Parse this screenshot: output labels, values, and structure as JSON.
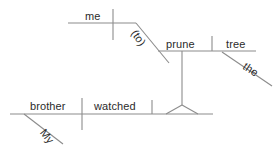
{
  "diagram": {
    "type": "reed-kellogg-sentence-diagram",
    "sentence": "My brother watched me prune the tree.",
    "canvas": {
      "width": 278,
      "height": 154
    },
    "stroke_color": "#8c8c8c",
    "text_color": "#2b2b2b",
    "background_color": "#ffffff",
    "words": {
      "subject": "brother",
      "subject_modifier": "My",
      "verb": "watched",
      "object_subject": "me",
      "infinitive_marker": "(to)",
      "infinitive_verb": "prune",
      "infinitive_object": "tree",
      "infinitive_object_modifier": "the"
    },
    "labels": [
      {
        "id": "me",
        "text": "me",
        "x": 85,
        "y": 10,
        "rotation": 0
      },
      {
        "id": "to",
        "text": "(to)",
        "x": 129,
        "y": 22,
        "rotation": 56
      },
      {
        "id": "prune",
        "text": "prune",
        "x": 166,
        "y": 38,
        "rotation": 0
      },
      {
        "id": "tree",
        "text": "tree",
        "x": 226,
        "y": 38,
        "rotation": 0
      },
      {
        "id": "the",
        "text": "the",
        "x": 241,
        "y": 58,
        "rotation": 34
      },
      {
        "id": "brother",
        "text": "brother",
        "x": 30,
        "y": 100,
        "rotation": 0
      },
      {
        "id": "my",
        "text": "My",
        "x": 38,
        "y": 122,
        "rotation": 52
      },
      {
        "id": "watched",
        "text": "watched",
        "x": 94,
        "y": 100,
        "rotation": 0
      }
    ],
    "lines": [
      {
        "id": "me-baseline",
        "x1": 68,
        "y1": 23,
        "x2": 136,
        "y2": 23
      },
      {
        "id": "me-divider",
        "x1": 113,
        "y1": 9,
        "x2": 113,
        "y2": 40
      },
      {
        "id": "infinitive-diagonal",
        "x1": 136,
        "y1": 23,
        "x2": 169,
        "y2": 63
      },
      {
        "id": "prune-baseline",
        "x1": 158,
        "y1": 51,
        "x2": 256,
        "y2": 51
      },
      {
        "id": "prune-object-divider",
        "x1": 212,
        "y1": 36,
        "x2": 212,
        "y2": 51
      },
      {
        "id": "the-diagonal",
        "x1": 222,
        "y1": 52,
        "x2": 272,
        "y2": 86
      },
      {
        "id": "infinitive-stem",
        "x1": 182,
        "y1": 51,
        "x2": 182,
        "y2": 105
      },
      {
        "id": "tripod-left",
        "x1": 182,
        "y1": 105,
        "x2": 166,
        "y2": 114
      },
      {
        "id": "tripod-right",
        "x1": 182,
        "y1": 105,
        "x2": 198,
        "y2": 114
      },
      {
        "id": "main-baseline",
        "x1": 10,
        "y1": 114,
        "x2": 213,
        "y2": 114
      },
      {
        "id": "subject-verb-divider",
        "x1": 82,
        "y1": 98,
        "x2": 82,
        "y2": 130
      },
      {
        "id": "verb-object-divider",
        "x1": 152,
        "y1": 100,
        "x2": 152,
        "y2": 114
      },
      {
        "id": "my-diagonal",
        "x1": 24,
        "y1": 114,
        "x2": 63,
        "y2": 144
      }
    ]
  }
}
